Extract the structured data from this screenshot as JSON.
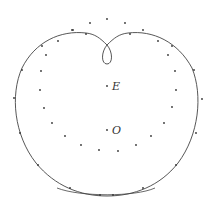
{
  "diagram": {
    "type": "curve-construction",
    "curve_color": "#444444",
    "dot_color": "#333333",
    "labels": [
      {
        "id": "E",
        "text": "E",
        "point": [
          107,
          86
        ]
      },
      {
        "id": "O",
        "text": "O",
        "point": [
          107,
          130
        ]
      }
    ],
    "inner_points": [
      [
        90,
        23
      ],
      [
        107,
        19
      ],
      [
        125,
        23
      ],
      [
        143,
        30
      ],
      [
        158,
        41
      ],
      [
        168,
        55
      ],
      [
        175,
        71
      ],
      [
        176,
        90
      ],
      [
        172,
        107
      ],
      [
        164,
        123
      ],
      [
        151,
        136
      ],
      [
        136,
        145
      ],
      [
        118,
        151
      ],
      [
        99,
        150
      ],
      [
        81,
        145
      ],
      [
        65,
        136
      ],
      [
        52,
        123
      ],
      [
        44,
        108
      ],
      [
        40,
        90
      ],
      [
        41,
        71
      ],
      [
        46,
        55
      ],
      [
        58,
        41
      ],
      [
        72,
        30
      ]
    ],
    "curve_points": [
      [
        73,
        30
      ],
      [
        42,
        46
      ],
      [
        22,
        70
      ],
      [
        14,
        98
      ],
      [
        20,
        133
      ],
      [
        38,
        165
      ],
      [
        70,
        188
      ],
      [
        100,
        195
      ],
      [
        113,
        195
      ],
      [
        143,
        188
      ],
      [
        176,
        165
      ],
      [
        196,
        133
      ],
      [
        202,
        99
      ],
      [
        194,
        70
      ],
      [
        172,
        46
      ],
      [
        130,
        34
      ],
      [
        86,
        34
      ]
    ]
  }
}
